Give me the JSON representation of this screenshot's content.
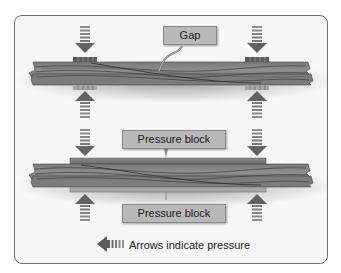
{
  "diagram": {
    "colors": {
      "panel_border": "#6e6e6e",
      "panel_bg": "#f7f7f7",
      "wood_dark": "#5a5a5a",
      "wood_light": "#8c8c8c",
      "arrow": "#6a6a6a",
      "label_bg": "#b9b9b9"
    },
    "top_assembly": {
      "callout": "Gap"
    },
    "bottom_assembly": {
      "top_label": "Pressure block",
      "bottom_label": "Pressure block"
    },
    "legend": {
      "text": "Arrows indicate pressure",
      "icon": "pressure-arrow-icon"
    }
  }
}
